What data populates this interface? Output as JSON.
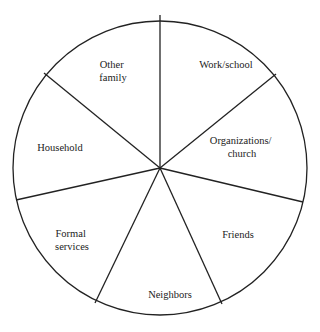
{
  "diagram": {
    "type": "segmented-circle",
    "center": {
      "x": 160,
      "y": 168
    },
    "radius": 147,
    "stroke_color": "#222222",
    "text_color": "#222222",
    "background": "#ffffff",
    "spokes": [
      {
        "x": 160,
        "y": 15
      },
      {
        "x": 276,
        "y": 74
      },
      {
        "x": 303,
        "y": 202
      },
      {
        "x": 222,
        "y": 304
      },
      {
        "x": 95,
        "y": 303
      },
      {
        "x": 16,
        "y": 200
      },
      {
        "x": 44,
        "y": 73
      }
    ],
    "segments": [
      {
        "id": "work-school",
        "lines": [
          "Work/school"
        ]
      },
      {
        "id": "organizations-church",
        "lines": [
          "Organizations/",
          "church"
        ]
      },
      {
        "id": "friends",
        "lines": [
          "Friends"
        ]
      },
      {
        "id": "neighbors",
        "lines": [
          "Neighbors"
        ]
      },
      {
        "id": "formal-services",
        "lines": [
          "Formal",
          "services"
        ]
      },
      {
        "id": "household",
        "lines": [
          "Household"
        ]
      },
      {
        "id": "other-family",
        "lines": [
          "Other",
          "family"
        ]
      }
    ]
  }
}
